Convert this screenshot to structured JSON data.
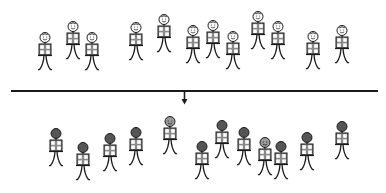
{
  "diagram": {
    "colors": {
      "outline": "#1a1a1a",
      "light_head_fill": "#ffffff",
      "dark_head_fill": "#555555",
      "light_face_fill": "#9a9a9a",
      "box_fill": "#8a8a8a",
      "box_inner": "#ffffff",
      "divider": "#1a1a1a"
    },
    "top_group": {
      "label": "before",
      "figures": [
        {
          "x": 35,
          "y": 31,
          "head": "light"
        },
        {
          "x": 63,
          "y": 20,
          "head": "light"
        },
        {
          "x": 82,
          "y": 31,
          "head": "light"
        },
        {
          "x": 126,
          "y": 21,
          "head": "light"
        },
        {
          "x": 154,
          "y": 13,
          "head": "light"
        },
        {
          "x": 183,
          "y": 24,
          "head": "light"
        },
        {
          "x": 203,
          "y": 19,
          "head": "light"
        },
        {
          "x": 223,
          "y": 30,
          "head": "light"
        },
        {
          "x": 248,
          "y": 10,
          "head": "light"
        },
        {
          "x": 268,
          "y": 20,
          "head": "light"
        },
        {
          "x": 303,
          "y": 30,
          "head": "light"
        },
        {
          "x": 332,
          "y": 24,
          "head": "light"
        }
      ]
    },
    "divider": {
      "x1": 11,
      "x2": 378,
      "y": 91
    },
    "arrow": {
      "x": 184,
      "y_start": 91,
      "y_end": 104,
      "direction": "down"
    },
    "bottom_group": {
      "label": "after",
      "figures": [
        {
          "x": 46,
          "y": 127,
          "head": "dark"
        },
        {
          "x": 73,
          "y": 141,
          "head": "dark"
        },
        {
          "x": 100,
          "y": 132,
          "head": "dark"
        },
        {
          "x": 126,
          "y": 126,
          "head": "dark"
        },
        {
          "x": 160,
          "y": 115,
          "head": "grey-smiling"
        },
        {
          "x": 192,
          "y": 140,
          "head": "dark"
        },
        {
          "x": 212,
          "y": 119,
          "head": "dark"
        },
        {
          "x": 234,
          "y": 126,
          "head": "dark"
        },
        {
          "x": 255,
          "y": 136,
          "head": "grey-smiling"
        },
        {
          "x": 271,
          "y": 140,
          "head": "dark"
        },
        {
          "x": 297,
          "y": 131,
          "head": "dark"
        },
        {
          "x": 332,
          "y": 120,
          "head": "dark"
        }
      ]
    }
  }
}
